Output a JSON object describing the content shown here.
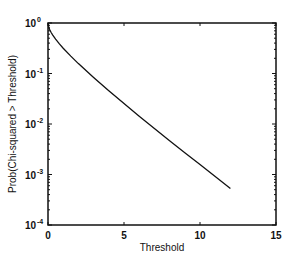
{
  "chart_data": {
    "type": "line",
    "title": "",
    "xlabel": "Threshold",
    "ylabel": "Prob(Chi-squared > Threshold)",
    "xscale": "linear",
    "yscale": "log",
    "xlim": [
      0,
      15
    ],
    "ylim": [
      0.0001,
      1
    ],
    "xticks": [
      0,
      5,
      10,
      15
    ],
    "xtick_labels": [
      "0",
      "5",
      "10",
      "15"
    ],
    "yticks": [
      0.0001,
      0.001,
      0.01,
      0.1,
      1
    ],
    "ytick_labels": [
      {
        "base": "10",
        "exp": "-4"
      },
      {
        "base": "10",
        "exp": "-3"
      },
      {
        "base": "10",
        "exp": "-2"
      },
      {
        "base": "10",
        "exp": "-1"
      },
      {
        "base": "10",
        "exp": "0"
      }
    ],
    "grid": false,
    "legend": null,
    "series": [
      {
        "name": "Prob(Chi-squared > Threshold)",
        "color": "#111111",
        "x": [
          0.0,
          0.05,
          0.1,
          0.2,
          0.3,
          0.5,
          0.75,
          1.0,
          1.5,
          2.0,
          2.5,
          3.0,
          4.0,
          5.0,
          6.0,
          7.0,
          8.0,
          9.0,
          10.0,
          11.0,
          12.0
        ],
        "y": [
          1.0,
          0.823,
          0.752,
          0.655,
          0.584,
          0.48,
          0.386,
          0.317,
          0.221,
          0.157,
          0.114,
          0.0833,
          0.0455,
          0.0253,
          0.0143,
          0.00815,
          0.00468,
          0.0027,
          0.00157,
          0.00091,
          0.00053
        ]
      }
    ]
  }
}
